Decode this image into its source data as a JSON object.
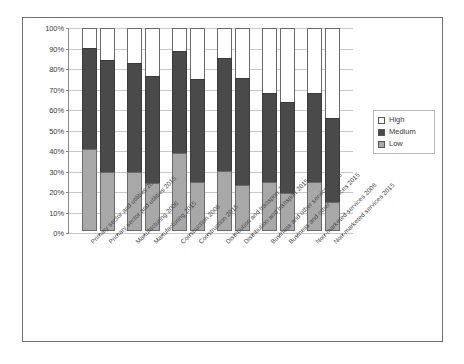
{
  "chart_data": {
    "type": "bar",
    "subtype": "stacked-percentage-column",
    "title": "",
    "xlabel": "",
    "ylabel": "",
    "ylim": [
      0,
      100
    ],
    "ytick_labels": [
      "0%",
      "10%",
      "20%",
      "30%",
      "40%",
      "50%",
      "60%",
      "70%",
      "80%",
      "90%",
      "100%"
    ],
    "ytick_values": [
      0,
      10,
      20,
      30,
      40,
      50,
      60,
      70,
      80,
      90,
      100
    ],
    "grid": true,
    "legend_position": "right",
    "categories": [
      "Primary sector and utilities  2006",
      "Primary sector and utilities 2015",
      "Manufacturing   2006",
      "Manufacturing  2015",
      "Construction   2006",
      "Construction  2015",
      "Distribution and transport  2006",
      "Distribution and transport  2015",
      "Business and other services  2006",
      "Business and other services  2015",
      "Non-marketed services  2006",
      "Non-marketed services  2015"
    ],
    "series": [
      {
        "name": "Low",
        "color": "#a8a8a8",
        "values": [
          40,
          29,
          29,
          23.5,
          38,
          24,
          29.5,
          22.5,
          24,
          18.5,
          24,
          14
        ]
      },
      {
        "name": "Medium",
        "color": "#4a4a4a",
        "values": [
          50,
          55,
          53.5,
          52.5,
          50.5,
          50.5,
          55.5,
          52.5,
          44,
          45,
          44,
          41.5
        ]
      },
      {
        "name": "High",
        "color": "#ffffff",
        "values": [
          10,
          16,
          17.5,
          24,
          11.5,
          25.5,
          15,
          25,
          32,
          36.5,
          32,
          44.5
        ]
      }
    ],
    "stack_order_bottom_to_top": [
      "Low",
      "Medium",
      "High"
    ]
  },
  "legend": {
    "items": [
      {
        "label": "High",
        "swatch": "sw-high"
      },
      {
        "label": "Medium",
        "swatch": "sw-medium"
      },
      {
        "label": "Low",
        "swatch": "sw-low"
      }
    ]
  },
  "colors": {
    "low": "#a8a8a8",
    "medium": "#4a4a4a",
    "high": "#ffffff",
    "frame": "#6e7074",
    "grid": "#c9c9c9",
    "axis": "#8a8a8a",
    "text": "#3a3a3a"
  }
}
